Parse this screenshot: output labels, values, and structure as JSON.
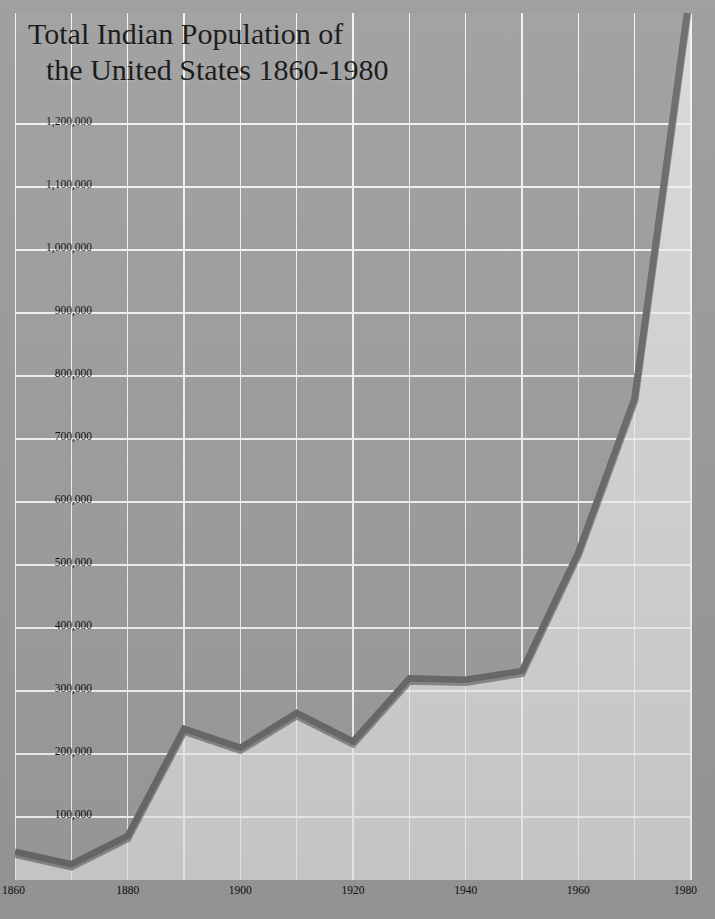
{
  "chart_data": {
    "type": "area",
    "title": "Total Indian Population of the United States 1860-1980",
    "title_line1": "Total Indian Population of",
    "title_line2": "the United States 1860-1980",
    "xlabel": "",
    "ylabel": "",
    "x": [
      1860,
      1870,
      1880,
      1890,
      1900,
      1910,
      1920,
      1930,
      1940,
      1950,
      1960,
      1970,
      1980
    ],
    "values": [
      45000,
      25000,
      70000,
      240000,
      210000,
      265000,
      220000,
      320000,
      318000,
      332000,
      520000,
      765000,
      1420000
    ],
    "categories": [
      "1860",
      "1870",
      "1880",
      "1890",
      "1900",
      "1910",
      "1920",
      "1930",
      "1940",
      "1950",
      "1960",
      "1970",
      "1980"
    ],
    "xlim": [
      1860,
      1980
    ],
    "ylim": [
      0,
      1260000
    ],
    "ytick_values": [
      100000,
      200000,
      300000,
      400000,
      500000,
      600000,
      700000,
      800000,
      900000,
      1000000,
      1100000,
      1200000
    ],
    "ytick_labels": [
      "100,000",
      "200,000",
      "300,000",
      "400,000",
      "500,000",
      "600,000",
      "700,000",
      "800,000",
      "900,000",
      "1,000,000",
      "1,100,000",
      "1,200,000"
    ],
    "xtick_values": [
      1860,
      1880,
      1900,
      1920,
      1940,
      1960,
      1980
    ],
    "xtick_labels": [
      "1860",
      "1880",
      "1900",
      "1920",
      "1940",
      "1960",
      "1980"
    ],
    "grid": true,
    "gridline_color": "#e8e8e8",
    "legend": null,
    "series_line_color": "#5f5f5f",
    "area_fill_color": "#d4d4d4",
    "plot_background_color": "#9e9e9e",
    "page_background_color": "#9b9b9b",
    "note": "Line rises above the top of the plotted grid at 1980"
  },
  "axis": {
    "y_labels": [
      "1,200,000",
      "1,100,000",
      "1,000,000",
      "900,000",
      "800,000",
      "700,000",
      "600,000",
      "500,000",
      "400,000",
      "300,000",
      "200,000",
      "100,000"
    ],
    "x_labels": [
      "1860",
      "1880",
      "1900",
      "1920",
      "1940",
      "1960",
      "1980"
    ]
  }
}
